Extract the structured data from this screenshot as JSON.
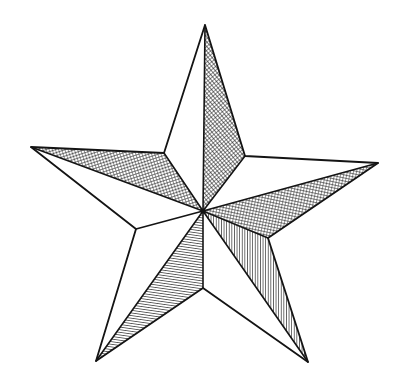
{
  "artwork": {
    "title": "Five-Pointed Star",
    "subject": "star",
    "style": "pen-and-ink line drawing with hatched shading",
    "background_color": "#ffffff",
    "ink_color": "#141414",
    "hatch_color": "#1c1c1c",
    "canvas": {
      "width": 400,
      "height": 390
    },
    "stroke_width": 1.6
  },
  "geometry": {
    "center": {
      "x": 203,
      "y": 211
    },
    "outer_points": [
      {
        "name": "top",
        "x": 205,
        "y": 25
      },
      {
        "name": "right",
        "x": 378,
        "y": 163
      },
      {
        "name": "bottom-right",
        "x": 308,
        "y": 362
      },
      {
        "name": "bottom-left",
        "x": 96,
        "y": 361
      },
      {
        "name": "left",
        "x": 31,
        "y": 147
      }
    ],
    "inner_points": [
      {
        "name": "upper-right",
        "x": 245,
        "y": 156
      },
      {
        "name": "lower-right",
        "x": 268,
        "y": 238
      },
      {
        "name": "bottom",
        "x": 203,
        "y": 288
      },
      {
        "name": "lower-left",
        "x": 136,
        "y": 229
      },
      {
        "name": "upper-left",
        "x": 164,
        "y": 153
      }
    ]
  },
  "facets": [
    {
      "name": "top-point-left-facet",
      "point": "top",
      "side": "left",
      "fill": "white",
      "hatch": "none",
      "path": "M 203 211 L 164 153 L 205 25 Z"
    },
    {
      "name": "top-point-right-facet",
      "point": "top",
      "side": "right",
      "fill": "hatched",
      "hatch": "cross-hatch",
      "path": "M 203 211 L 205 25 L 245 156 Z"
    },
    {
      "name": "right-point-upper-facet",
      "point": "right",
      "side": "upper",
      "fill": "white",
      "hatch": "none",
      "path": "M 203 211 L 245 156 L 378 163 Z"
    },
    {
      "name": "right-point-lower-facet",
      "point": "right",
      "side": "lower",
      "fill": "hatched",
      "hatch": "cross-hatch",
      "path": "M 203 211 L 378 163 L 268 238 Z"
    },
    {
      "name": "bottom-right-point-left-facet",
      "point": "bottom-right",
      "side": "left",
      "fill": "hatched",
      "hatch": "vertical-lines",
      "path": "M 203 211 L 268 238 L 308 362 Z"
    },
    {
      "name": "bottom-right-point-right-facet",
      "point": "bottom-right",
      "side": "right",
      "fill": "white",
      "hatch": "none",
      "path": "M 203 211 L 308 362 L 203 288 Z"
    },
    {
      "name": "bottom-left-point-right-facet",
      "point": "bottom-left",
      "side": "right",
      "fill": "hatched",
      "hatch": "cross-hatch",
      "path": "M 203 211 L 203 288 L 96 361 Z"
    },
    {
      "name": "bottom-left-point-left-facet",
      "point": "bottom-left",
      "side": "left",
      "fill": "white",
      "hatch": "none",
      "path": "M 203 211 L 96 361 L 136 229 Z"
    },
    {
      "name": "left-point-lower-facet",
      "point": "left",
      "side": "lower",
      "fill": "white",
      "hatch": "none",
      "path": "M 203 211 L 136 229 L 31 147 Z"
    },
    {
      "name": "left-point-upper-facet",
      "point": "left",
      "side": "upper",
      "fill": "hatched",
      "hatch": "cross-hatch",
      "path": "M 203 211 L 31 147 L 164 153 Z"
    }
  ],
  "outline": {
    "name": "star-outline",
    "path": "M 205 25 L 245 156 L 378 163 L 268 238 L 308 362 L 203 288 L 96 361 L 136 229 L 31 147 L 164 153 Z"
  },
  "spokes": [
    {
      "name": "spoke-to-upper-left",
      "path": "M 203 211 L 164 153"
    },
    {
      "name": "spoke-to-upper-right",
      "path": "M 203 211 L 245 156"
    },
    {
      "name": "spoke-to-lower-right",
      "path": "M 203 211 L 268 238"
    },
    {
      "name": "spoke-to-bottom",
      "path": "M 203 211 L 203 288"
    },
    {
      "name": "spoke-to-lower-left",
      "path": "M 203 211 L 136 229"
    },
    {
      "name": "ridge-to-top-tip",
      "path": "M 203 211 L 205 25"
    },
    {
      "name": "ridge-to-right-tip",
      "path": "M 203 211 L 378 163"
    },
    {
      "name": "ridge-to-bottom-right-tip",
      "path": "M 203 211 L 308 362"
    },
    {
      "name": "ridge-to-bottom-left-tip",
      "path": "M 203 211 L 96 361"
    },
    {
      "name": "ridge-to-left-tip",
      "path": "M 203 211 L 31 147"
    }
  ]
}
